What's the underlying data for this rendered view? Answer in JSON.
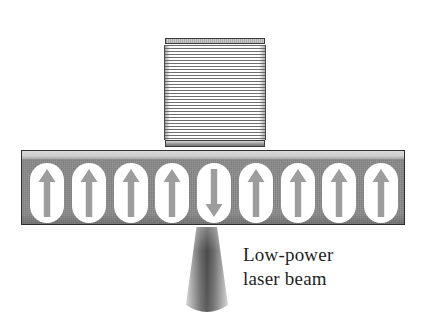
{
  "figure": {
    "background_color": "#ffffff"
  },
  "recording_head": {
    "name": "striped-head-block",
    "stripe_dark_color": "#6f6f6f",
    "stripe_light_color": "#ffffff",
    "cap_color": "#9a9a9a",
    "outline_color": "#3a3a3a"
  },
  "medium": {
    "name": "magnetic-medium-strip",
    "body_color": "#8a8a8a",
    "highlight_color": "#d9d9d9",
    "outline_color": "#2e2e2e",
    "domain_fill_color": "#ffffff",
    "arrow_color": "#9d9d9d",
    "domain_count": 9,
    "domains": [
      {
        "index": 1,
        "direction": "up"
      },
      {
        "index": 2,
        "direction": "up"
      },
      {
        "index": 3,
        "direction": "up"
      },
      {
        "index": 4,
        "direction": "up"
      },
      {
        "index": 5,
        "direction": "down"
      },
      {
        "index": 6,
        "direction": "up"
      },
      {
        "index": 7,
        "direction": "up"
      },
      {
        "index": 8,
        "direction": "up"
      },
      {
        "index": 9,
        "direction": "up"
      }
    ]
  },
  "laser": {
    "name": "low-power-laser-beam",
    "beam_core_color": "#4e4e4e",
    "beam_edge_color": "#d2d2d2",
    "caption_line_1": "Low-power",
    "caption_line_2": "laser beam",
    "caption_color": "#1f1f1f"
  }
}
